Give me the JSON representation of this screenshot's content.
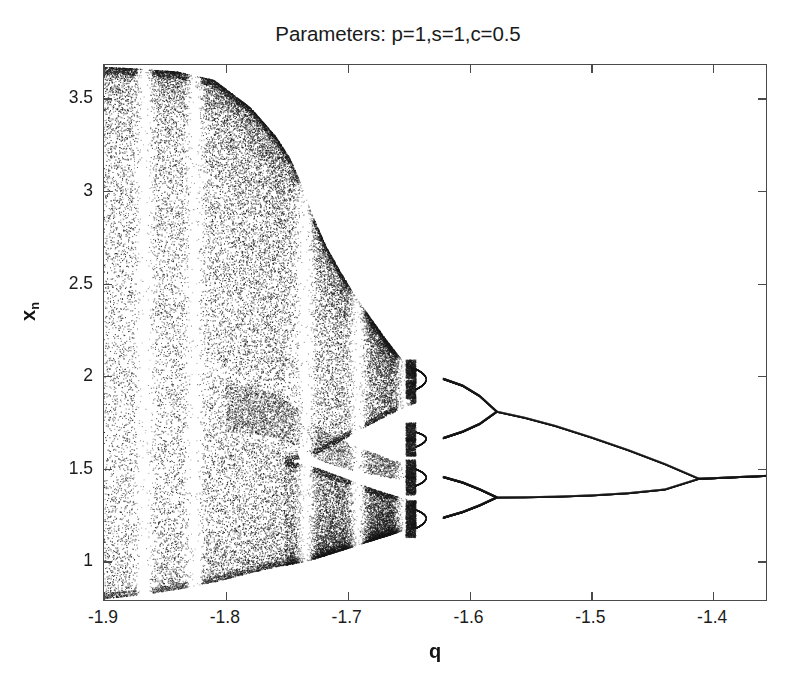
{
  "figure": {
    "title": "Parameters: p=1,s=1,c=0.5",
    "xlabel": "q",
    "ylabel_base": "x",
    "ylabel_sub": "n",
    "background_color": "#ffffff",
    "axis_color": "#4a4a4a",
    "point_color": "#1a1a1a"
  },
  "chart_data": {
    "type": "scatter",
    "title": "Parameters: p=1,s=1,c=0.5",
    "subtitle": "",
    "xlabel": "q",
    "ylabel": "x_n",
    "grid": false,
    "legend": null,
    "xlim": [
      -1.9,
      -1.355
    ],
    "ylim": [
      0.78,
      3.68
    ],
    "xticks": [
      -1.9,
      -1.8,
      -1.7,
      -1.6,
      -1.5,
      -1.4
    ],
    "xtick_labels": [
      "-1.9",
      "-1.8",
      "-1.7",
      "-1.6",
      "-1.5",
      "-1.4"
    ],
    "yticks": [
      1,
      1.5,
      2,
      2.5,
      3,
      3.5
    ],
    "ytick_labels": [
      "1",
      "1.5",
      "2",
      "2.5",
      "3",
      "3.5"
    ],
    "parameters": {
      "p": 1,
      "s": 1,
      "c": 0.5
    },
    "bifurcation_points": [
      {
        "period_from": 1,
        "period_to": 2,
        "q": -1.412,
        "x": 1.446
      },
      {
        "period_from": 2,
        "period_to": 4,
        "q": -1.578,
        "x_upper": 1.808,
        "x_lower": 1.345
      },
      {
        "period_from": 4,
        "period_to": 8,
        "q": -1.622,
        "x_branches": [
          1.985,
          1.665,
          1.455,
          1.235
        ]
      },
      {
        "period_from": 8,
        "period_to": 16,
        "q": -1.636,
        "x_branches": [
          2.04,
          1.93,
          1.7,
          1.62,
          1.5,
          1.41,
          1.28,
          1.18
        ]
      }
    ],
    "chaos_onset_q": -1.6445,
    "branch_1": {
      "q": [
        -1.355,
        -1.38,
        -1.4,
        -1.412
      ],
      "x": [
        1.462,
        1.455,
        1.449,
        1.446
      ]
    },
    "branch_2_upper": {
      "q": [
        -1.412,
        -1.44,
        -1.47,
        -1.5,
        -1.53,
        -1.555,
        -1.578
      ],
      "x": [
        1.446,
        1.525,
        1.6,
        1.668,
        1.731,
        1.775,
        1.808
      ]
    },
    "branch_2_lower": {
      "q": [
        -1.412,
        -1.44,
        -1.47,
        -1.5,
        -1.53,
        -1.555,
        -1.578
      ],
      "x": [
        1.446,
        1.388,
        1.368,
        1.356,
        1.349,
        1.346,
        1.345
      ]
    },
    "branch_4": {
      "q": [
        -1.578,
        -1.592,
        -1.606,
        -1.622
      ],
      "x_b1": [
        1.808,
        1.892,
        1.948,
        1.985
      ],
      "x_b2": [
        1.808,
        1.742,
        1.7,
        1.665
      ],
      "x_b3": [
        1.345,
        1.388,
        1.425,
        1.455
      ],
      "x_b4": [
        1.345,
        1.302,
        1.266,
        1.235
      ]
    },
    "periodic_windows_q": [
      -1.735,
      -1.692,
      -1.654,
      -1.826,
      -1.867
    ],
    "chaotic_envelope_upper": {
      "q": [
        -1.9,
        -1.87,
        -1.84,
        -1.81,
        -1.78,
        -1.76,
        -1.748,
        -1.74,
        -1.73,
        -1.718,
        -1.706,
        -1.694,
        -1.68,
        -1.668,
        -1.656,
        -1.645
      ],
      "x": [
        3.67,
        3.66,
        3.645,
        3.6,
        3.45,
        3.3,
        3.18,
        3.06,
        2.88,
        2.7,
        2.56,
        2.43,
        2.3,
        2.19,
        2.09,
        2.04
      ]
    },
    "chaotic_envelope_lower": {
      "q": [
        -1.9,
        -1.87,
        -1.84,
        -1.81,
        -1.78,
        -1.76,
        -1.748,
        -1.74,
        -1.73,
        -1.718,
        -1.706,
        -1.694,
        -1.68,
        -1.668,
        -1.656,
        -1.645
      ],
      "x": [
        0.8,
        0.82,
        0.85,
        0.89,
        0.94,
        0.97,
        0.985,
        0.995,
        1.01,
        1.035,
        1.06,
        1.085,
        1.115,
        1.14,
        1.165,
        1.18
      ]
    },
    "band_gap_upper": {
      "q": [
        -1.748,
        -1.742,
        -1.736,
        -1.73,
        -1.722,
        -1.714,
        -1.706,
        -1.698,
        -1.69,
        -1.68,
        -1.67,
        -1.66,
        -1.65,
        -1.645
      ],
      "x": [
        1.54,
        1.548,
        1.558,
        1.572,
        1.595,
        1.622,
        1.652,
        1.682,
        1.712,
        1.748,
        1.782,
        1.814,
        1.842,
        1.856
      ]
    },
    "band_gap_lower": {
      "q": [
        -1.748,
        -1.742,
        -1.736,
        -1.73,
        -1.722,
        -1.714,
        -1.706,
        -1.698,
        -1.69,
        -1.68,
        -1.67,
        -1.66,
        -1.65,
        -1.645
      ],
      "x": [
        1.54,
        1.534,
        1.526,
        1.515,
        1.498,
        1.478,
        1.458,
        1.438,
        1.418,
        1.394,
        1.372,
        1.352,
        1.334,
        1.326
      ]
    },
    "total_points_rendered": 46000,
    "point_size_px": 1.0
  }
}
